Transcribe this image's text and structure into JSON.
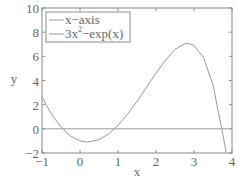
{
  "chart_data": {
    "type": "line",
    "title": "",
    "xlabel": "x",
    "ylabel": "y",
    "xlim": [
      -1,
      4
    ],
    "ylim": [
      -2,
      10
    ],
    "xticks": [
      -1,
      0,
      1,
      2,
      3,
      4
    ],
    "yticks": [
      -2,
      0,
      2,
      4,
      6,
      8,
      10
    ],
    "xtick_labels": [
      "−1",
      "0",
      "1",
      "2",
      "3",
      "4"
    ],
    "ytick_labels": [
      "−2",
      "0",
      "2",
      "4",
      "6",
      "8",
      "10"
    ],
    "grid": false,
    "legend_position": "upper left",
    "series": [
      {
        "name": "x-axis",
        "legend_label": "x−axis",
        "color": "#9a9a9a",
        "x": [
          -1,
          4
        ],
        "y": [
          0,
          0
        ]
      },
      {
        "name": "3x^2-exp(x)",
        "legend_label_base": "3x",
        "legend_label_sup": "2",
        "legend_label_rest": "−exp(x)",
        "color": "#9a9a9a",
        "x": [
          -1.0,
          -0.75,
          -0.5,
          -0.25,
          0.0,
          0.2,
          0.5,
          0.75,
          1.0,
          1.25,
          1.5,
          1.75,
          2.0,
          2.25,
          2.5,
          2.75,
          2.83,
          3.0,
          3.25,
          3.5,
          3.75,
          3.85
        ],
        "y": [
          2.63,
          1.21,
          0.14,
          -0.59,
          -1.0,
          -1.1,
          -0.9,
          -0.43,
          0.28,
          1.2,
          2.27,
          3.43,
          4.61,
          5.69,
          6.57,
          7.04,
          7.08,
          6.91,
          5.91,
          3.63,
          -0.33,
          -2.0
        ]
      }
    ]
  },
  "legend": {
    "item1": "x−axis",
    "item2_base": "3x",
    "item2_sup": "2",
    "item2_rest": "−exp(x)"
  },
  "axes": {
    "xlabel": "x",
    "ylabel": "y"
  },
  "colors": {
    "axis": "#888888",
    "line": "#9a9a9a",
    "text": "#666666"
  }
}
